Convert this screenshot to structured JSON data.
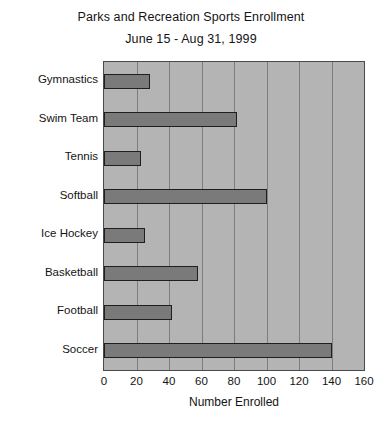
{
  "chart_data": {
    "type": "bar",
    "orientation": "horizontal",
    "title": "Parks and Recreation Sports Enrollment",
    "subtitle": "June 15 - Aug 31, 1999",
    "xlabel": "Number Enrolled",
    "ylabel": "",
    "categories": [
      "Gymnastics",
      "Swim Team",
      "Tennis",
      "Softball",
      "Ice Hockey",
      "Basketball",
      "Football",
      "Soccer"
    ],
    "values": [
      28,
      82,
      23,
      100,
      25,
      58,
      42,
      140
    ],
    "xlim": [
      0,
      160
    ],
    "xticks": [
      0,
      20,
      40,
      60,
      80,
      100,
      120,
      140,
      160
    ],
    "grid": true,
    "legend": false,
    "colors": {
      "bar_fill": "#7a7a7a",
      "bar_border": "#1f1f1f",
      "plot_background": "#b4b4b4",
      "gridline": "#7d7d7d",
      "axis_frame": "#4a4a4a",
      "text": "#141414",
      "page_background": "#ffffff"
    }
  }
}
